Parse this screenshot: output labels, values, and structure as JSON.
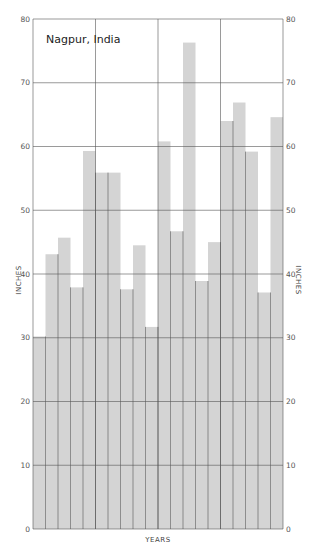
{
  "chart_data": {
    "type": "bar",
    "title": "Nagpur, India",
    "xlabel": "YEARS",
    "ylabel": "INCHES",
    "ylabel_right": "INCHES",
    "ylim": [
      0,
      80
    ],
    "yticks": [
      0,
      10,
      20,
      30,
      40,
      50,
      60,
      70,
      80
    ],
    "grid": true,
    "legend": null,
    "categories": [
      "1",
      "2",
      "3",
      "4",
      "5",
      "6",
      "7",
      "8",
      "9",
      "10",
      "11",
      "12",
      "13",
      "14",
      "15",
      "16",
      "17",
      "18",
      "19",
      "20"
    ],
    "values": [
      30.2,
      43.1,
      45.7,
      37.9,
      59.3,
      55.9,
      55.9,
      37.6,
      44.5,
      31.7,
      60.8,
      46.7,
      76.3,
      38.9,
      45.0,
      64.0,
      66.9,
      59.2,
      37.1,
      64.6
    ],
    "bar_color": "#d4d4d4",
    "grid_color": "#555555",
    "vertical_grid_every": 5
  }
}
